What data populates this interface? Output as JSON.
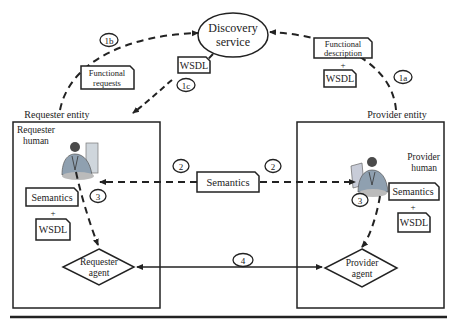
{
  "diagram": {
    "discovery": {
      "line1": "Discovery",
      "line2": "service"
    },
    "requester_entity_label": "Requester entity",
    "provider_entity_label": "Provider entity",
    "requester_human": {
      "line1": "Requester",
      "line2": "human"
    },
    "provider_human": {
      "line1": "Provider",
      "line2": "human"
    },
    "requester_agent": {
      "line1": "Requester",
      "line2": "agent"
    },
    "provider_agent": {
      "line1": "Provider",
      "line2": "agent"
    },
    "docs": {
      "functional_requests": {
        "line1": "Functional",
        "line2": "requests"
      },
      "wsdl_1c": "WSDL",
      "functional_description": {
        "line1": "Functional",
        "line2": "description"
      },
      "plus_top": "+",
      "wsdl_1a": "WSDL",
      "semantics_center": "Semantics",
      "req_semantics": "Semantics",
      "req_plus": "+",
      "req_wsdl": "WSDL",
      "prov_semantics": "Semantics",
      "prov_plus": "+",
      "prov_wsdl": "WSDL"
    },
    "steps": {
      "s1a": "1a",
      "s1b": "1b",
      "s1c": "1c",
      "s2_left": "2",
      "s2_right": "2",
      "s3_left": "3",
      "s3_right": "3",
      "s4": "4"
    },
    "colors": {
      "line": "#222222",
      "background": "#ffffff"
    }
  }
}
